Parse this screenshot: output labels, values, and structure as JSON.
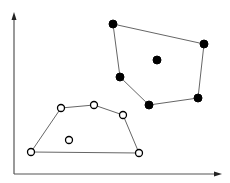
{
  "diagram": {
    "clusters": [
      {
        "name": "filled-cluster",
        "marker": "filled",
        "color": "#000000",
        "points": [
          [
            113,
            24
          ],
          [
            204,
            44
          ],
          [
            157,
            60
          ],
          [
            120,
            77
          ],
          [
            149,
            105
          ],
          [
            198,
            98
          ]
        ],
        "hull_order": [
          0,
          1,
          5,
          4,
          3
        ]
      },
      {
        "name": "open-cluster",
        "marker": "open",
        "color": "#000000",
        "points": [
          [
            61,
            108
          ],
          [
            94,
            105
          ],
          [
            123,
            115
          ],
          [
            31,
            152
          ],
          [
            69,
            140
          ],
          [
            139,
            153
          ]
        ],
        "hull_order": [
          3,
          0,
          1,
          2,
          5
        ]
      }
    ]
  }
}
